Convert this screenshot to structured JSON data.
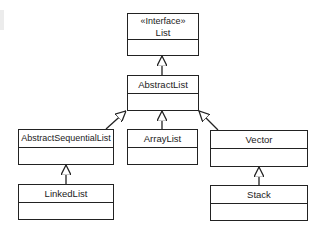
{
  "diagram": {
    "type": "uml-class-hierarchy",
    "classes": [
      {
        "id": "list",
        "stereotype": "«Interface»",
        "name": "List"
      },
      {
        "id": "abstractlist",
        "name": "AbstractList"
      },
      {
        "id": "abstractsequentiallist",
        "name": "AbstractSequentialList"
      },
      {
        "id": "arraylist",
        "name": "ArrayList"
      },
      {
        "id": "vector",
        "name": "Vector"
      },
      {
        "id": "linkedlist",
        "name": "LinkedList"
      },
      {
        "id": "stack",
        "name": "Stack"
      }
    ],
    "relations": [
      {
        "from": "abstractlist",
        "to": "list",
        "kind": "realization"
      },
      {
        "from": "abstractsequentiallist",
        "to": "abstractlist",
        "kind": "generalization"
      },
      {
        "from": "arraylist",
        "to": "abstractlist",
        "kind": "generalization"
      },
      {
        "from": "vector",
        "to": "abstractlist",
        "kind": "generalization"
      },
      {
        "from": "linkedlist",
        "to": "abstractsequentiallist",
        "kind": "generalization"
      },
      {
        "from": "stack",
        "to": "vector",
        "kind": "generalization"
      }
    ],
    "colors": {
      "line": "#222222",
      "background": "#ffffff"
    }
  }
}
